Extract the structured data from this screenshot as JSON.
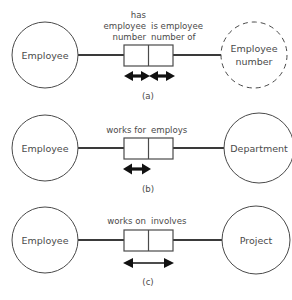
{
  "figure": {
    "background_color": "#ffffff",
    "line_color": "#4a4a4a",
    "arrow_color": "#111111"
  },
  "panels": [
    {
      "id": "a",
      "caption": "(a)",
      "left_entity": {
        "label": "Employee",
        "shape": "circle",
        "border": "solid"
      },
      "right_entity": {
        "label_line1": "Employee",
        "label_line2": "number",
        "shape": "circle",
        "border": "dashed"
      },
      "relationship": {
        "left_label_lines": [
          "has",
          "employee",
          "number"
        ],
        "left_label_align": "right",
        "right_label_lines": [
          "is employee",
          "number of"
        ],
        "right_label_align": "left",
        "arrows": [
          {
            "style": "thick-double",
            "span": "left-half"
          },
          {
            "style": "thick-double",
            "span": "right-half"
          }
        ]
      }
    },
    {
      "id": "b",
      "caption": "(b)",
      "left_entity": {
        "label": "Employee",
        "shape": "circle",
        "border": "solid"
      },
      "right_entity": {
        "label_line1": "Department",
        "label_line2": "",
        "shape": "circle",
        "border": "solid"
      },
      "relationship": {
        "left_label_lines": [
          "works for"
        ],
        "left_label_align": "right",
        "right_label_lines": [
          "employs"
        ],
        "right_label_align": "left",
        "arrows": [
          {
            "style": "thick-double",
            "span": "left-half"
          }
        ]
      }
    },
    {
      "id": "c",
      "caption": "(c)",
      "left_entity": {
        "label": "Employee",
        "shape": "circle",
        "border": "solid"
      },
      "right_entity": {
        "label_line1": "Project",
        "label_line2": "",
        "shape": "circle",
        "border": "solid"
      },
      "relationship": {
        "left_label_lines": [
          "works on"
        ],
        "left_label_align": "right",
        "right_label_lines": [
          "involves"
        ],
        "right_label_align": "left",
        "arrows": [
          {
            "style": "thin-double",
            "span": "full"
          }
        ]
      }
    }
  ]
}
